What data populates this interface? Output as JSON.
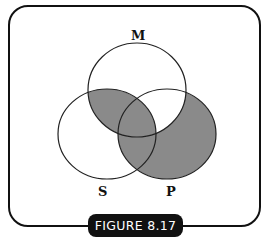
{
  "figure": {
    "caption": "FIGURE 8.17",
    "type": "venn-diagram",
    "sets": [
      {
        "label": "M",
        "cx": 137,
        "cy": 90,
        "rx": 49,
        "ry": 47
      },
      {
        "label": "S",
        "cx": 107,
        "cy": 134,
        "rx": 49,
        "ry": 45
      },
      {
        "label": "P",
        "cx": 167,
        "cy": 134,
        "rx": 49,
        "ry": 45
      }
    ],
    "shaded_regions": [
      "M∩S (not P)",
      "M∩S∩P",
      "S∩P (not M)",
      "P only"
    ],
    "shade_color": "#8a8a8a",
    "stroke_color": "#222222"
  }
}
